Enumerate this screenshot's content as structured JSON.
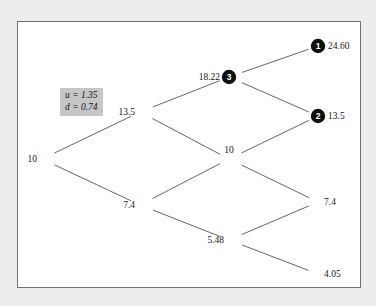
{
  "figure": {
    "parameters": {
      "up_factor_label": "u = 1.35",
      "down_factor_label": "d = 0.74"
    },
    "markers": [
      {
        "id": "1",
        "label": "1"
      },
      {
        "id": "2",
        "label": "2"
      },
      {
        "id": "3",
        "label": "3"
      }
    ],
    "node_values": {
      "root": "10",
      "step1_up": "13.5",
      "step1_down": "7.4",
      "step2_up": "18.22",
      "step2_mid": "10",
      "step2_down": "5.48",
      "step3_uuu": "24.60",
      "step3_uud": "13.5",
      "step3_udd": "7.4",
      "step3_ddd": "4.05"
    }
  },
  "chart_data": {
    "type": "diagram",
    "title": "",
    "subtitle": "",
    "diagram_kind": "recombining-binomial-lattice",
    "steps": 3,
    "up_factor": 1.35,
    "down_factor": 0.74,
    "annotations": [
      "u = 1.35",
      "d = 0.74"
    ],
    "legend": [],
    "grid": false,
    "nodes": [
      {
        "key": "root",
        "step": 0,
        "level": 0,
        "value": "10",
        "x": 24,
        "y": 137,
        "marker": null,
        "label_anchor": "end"
      },
      {
        "key": "step1_up",
        "step": 1,
        "level": 1,
        "value": "13.5",
        "x": 122,
        "y": 90,
        "marker": null,
        "label_anchor": "end"
      },
      {
        "key": "step1_down",
        "step": 1,
        "level": -1,
        "value": "7.4",
        "x": 122,
        "y": 183,
        "marker": null,
        "label_anchor": "end"
      },
      {
        "key": "step2_up",
        "step": 2,
        "level": 2,
        "value": "18.22",
        "x": 211,
        "y": 55,
        "marker": "3",
        "label_anchor": "end"
      },
      {
        "key": "step2_mid",
        "step": 2,
        "level": 0,
        "value": "10",
        "x": 211,
        "y": 137,
        "marker": null,
        "label_anchor": "middle"
      },
      {
        "key": "step2_down",
        "step": 2,
        "level": -2,
        "value": "5.48",
        "x": 211,
        "y": 218,
        "marker": null,
        "label_anchor": "end"
      },
      {
        "key": "step3_uuu",
        "step": 3,
        "level": 3,
        "value": "24.60",
        "x": 300,
        "y": 24,
        "marker": "1",
        "label_anchor": "start"
      },
      {
        "key": "step3_uud",
        "step": 3,
        "level": 1,
        "value": "13.5",
        "x": 300,
        "y": 94,
        "marker": "2",
        "label_anchor": "start"
      },
      {
        "key": "step3_udd",
        "step": 3,
        "level": -1,
        "value": "7.4",
        "x": 300,
        "y": 180,
        "marker": null,
        "label_anchor": "start"
      },
      {
        "key": "step3_ddd",
        "step": 3,
        "level": -3,
        "value": "4.05",
        "x": 300,
        "y": 252,
        "marker": null,
        "label_anchor": "start"
      }
    ],
    "edges": [
      {
        "from": "root",
        "to": "step1_up"
      },
      {
        "from": "root",
        "to": "step1_down"
      },
      {
        "from": "step1_up",
        "to": "step2_up"
      },
      {
        "from": "step1_up",
        "to": "step2_mid"
      },
      {
        "from": "step1_down",
        "to": "step2_mid"
      },
      {
        "from": "step1_down",
        "to": "step2_down"
      },
      {
        "from": "step2_up",
        "to": "step3_uuu"
      },
      {
        "from": "step2_up",
        "to": "step3_uud"
      },
      {
        "from": "step2_mid",
        "to": "step3_uud"
      },
      {
        "from": "step2_mid",
        "to": "step3_udd"
      },
      {
        "from": "step2_down",
        "to": "step3_udd"
      },
      {
        "from": "step2_down",
        "to": "step3_ddd"
      }
    ]
  }
}
